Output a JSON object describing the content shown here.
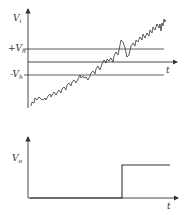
{
  "top_graph": {
    "y_label": "V",
    "y_label_sub": "i",
    "x_label": "t",
    "thresholds": [
      {
        "label": "+V",
        "sub": "h"
      },
      {
        "label": "-V",
        "sub": "h"
      }
    ]
  },
  "bottom_graph": {
    "y_label": "V",
    "y_label_sub": "o",
    "x_label": "t"
  },
  "colors": {
    "line": "#333333",
    "background": "#ffffff"
  }
}
